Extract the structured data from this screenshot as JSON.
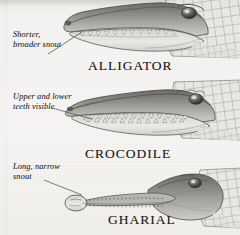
{
  "figure": {
    "medium": "grayscale illustration",
    "background_color": "#f4f3f1",
    "ink_color": "#2e2c2a"
  },
  "specimens": [
    {
      "id": "alligator",
      "caption": "ALLIGATOR",
      "annotation": "Shorter,\nbroader snout",
      "snout_shape": "broad, rounded, U-shaped",
      "teeth_note": "lower teeth hidden when jaw closed",
      "orientation": "facing right"
    },
    {
      "id": "crocodile",
      "caption": "CROCODILE",
      "annotation": "Upper and lower\nteeth visible",
      "snout_shape": "narrower, V-shaped",
      "teeth_note": "upper and lower teeth interlock and show",
      "orientation": "facing right"
    },
    {
      "id": "gharial",
      "caption": "GHARIAL",
      "annotation": "Long, narrow\nsnout",
      "snout_shape": "very long and slender with bulbous tip",
      "teeth_note": "many fine needle-like teeth",
      "orientation": "facing right"
    }
  ],
  "palette": {
    "paper": "#f4f3f1",
    "mid_gray": "#8d8b88",
    "dark_gray": "#5b5956",
    "shadow": "#3c3a38",
    "highlight": "#e6e4e0",
    "belly": "#dedcd7",
    "scale_line": "#6e6c68"
  }
}
